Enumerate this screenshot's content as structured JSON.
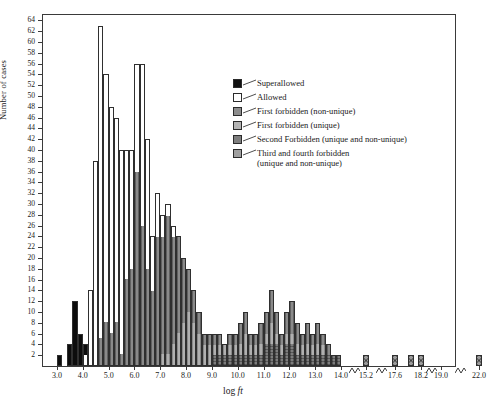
{
  "chart_data": {
    "type": "bar",
    "title": "",
    "xlabel": "log ft",
    "ylabel": "Number of cases",
    "ylim": [
      0,
      65
    ],
    "ytick_step": 2,
    "ytick_labels": [
      "2",
      "4",
      "6",
      "8",
      "10",
      "12",
      "14",
      "16",
      "18",
      "20",
      "22",
      "24",
      "26",
      "28",
      "30",
      "32",
      "34",
      "36",
      "38",
      "40",
      "42",
      "44",
      "46",
      "48",
      "50",
      "52",
      "54",
      "56",
      "58",
      "60",
      "62",
      "64"
    ],
    "xtick_labels": [
      "3.0",
      "4.0",
      "5.0",
      "6.0",
      "7.0",
      "8.0",
      "9.0",
      "10.0",
      "11.0",
      "12.0",
      "13.0",
      "14.0",
      "15.2",
      "17.6",
      "18.2",
      "19.0",
      "22.0"
    ],
    "grid": false,
    "legend_position": "upper-right",
    "axis_breaks": [
      "14.0-15.2",
      "15.2-17.6",
      "18.2-19.0",
      "19.0-22.0"
    ],
    "bin_width": 0.2,
    "categories": [
      "3.0",
      "3.2",
      "3.4",
      "3.6",
      "3.8",
      "4.0",
      "4.2",
      "4.4",
      "4.6",
      "4.8",
      "5.0",
      "5.2",
      "5.4",
      "5.6",
      "5.8",
      "6.0",
      "6.2",
      "6.4",
      "6.6",
      "6.8",
      "7.0",
      "7.2",
      "7.4",
      "7.6",
      "7.8",
      "8.0",
      "8.2",
      "8.4",
      "8.6",
      "8.8",
      "9.0",
      "9.2",
      "9.4",
      "9.6",
      "9.8",
      "10.0",
      "10.2",
      "10.4",
      "10.6",
      "10.8",
      "11.0",
      "11.2",
      "11.4",
      "11.6",
      "11.8",
      "12.0",
      "12.2",
      "12.4",
      "12.6",
      "12.8",
      "13.0",
      "13.2",
      "13.4",
      "13.6",
      "13.8",
      "15.2",
      "17.6",
      "18.0",
      "18.2",
      "19.0",
      "22.0"
    ],
    "series": [
      {
        "name": "Superallowed",
        "color": "#0d0d0d",
        "values": [
          2,
          0,
          4,
          12,
          6,
          2,
          0,
          0,
          0,
          0,
          0,
          0,
          0,
          0,
          0,
          0,
          0,
          0,
          0,
          0,
          0,
          0,
          0,
          0,
          0,
          0,
          0,
          0,
          0,
          0,
          0,
          0,
          0,
          0,
          0,
          0,
          0,
          0,
          0,
          0,
          0,
          0,
          0,
          0,
          0,
          0,
          0,
          0,
          0,
          0,
          0,
          0,
          0,
          0,
          0,
          0,
          0,
          0,
          0,
          0,
          0
        ]
      },
      {
        "name": "Allowed",
        "color": "#ffffff",
        "values": [
          0,
          0,
          0,
          0,
          0,
          2,
          14,
          38,
          58,
          46,
          42,
          38,
          38,
          24,
          22,
          20,
          30,
          24,
          10,
          8,
          4,
          2,
          2,
          0,
          0,
          0,
          0,
          0,
          0,
          0,
          0,
          0,
          0,
          0,
          0,
          0,
          0,
          0,
          0,
          0,
          0,
          0,
          0,
          0,
          0,
          0,
          0,
          0,
          0,
          0,
          0,
          0,
          0,
          0,
          0,
          0,
          0,
          0,
          0,
          0,
          0
        ]
      },
      {
        "name": "First forbidden (non-unique)",
        "color": "#8a8a8a",
        "values": [
          0,
          0,
          0,
          0,
          0,
          0,
          0,
          0,
          5,
          8,
          6,
          8,
          2,
          16,
          18,
          36,
          26,
          18,
          14,
          24,
          22,
          26,
          20,
          18,
          12,
          8,
          6,
          4,
          2,
          2,
          2,
          2,
          0,
          2,
          2,
          4,
          4,
          2,
          2,
          4,
          4,
          6,
          4,
          2,
          4,
          6,
          4,
          2,
          4,
          2,
          4,
          2,
          2,
          0,
          0,
          0,
          0,
          0,
          0,
          0,
          0
        ]
      },
      {
        "name": "First forbidden (unique)",
        "color": "#b0b0b0",
        "values": [
          0,
          0,
          0,
          0,
          0,
          0,
          0,
          0,
          0,
          0,
          0,
          0,
          0,
          0,
          0,
          0,
          0,
          0,
          0,
          0,
          2,
          2,
          4,
          6,
          8,
          10,
          8,
          6,
          4,
          4,
          2,
          2,
          2,
          2,
          2,
          2,
          4,
          2,
          2,
          2,
          2,
          4,
          2,
          2,
          2,
          2,
          2,
          2,
          2,
          2,
          2,
          2,
          0,
          0,
          0,
          0,
          0,
          0,
          0,
          0,
          0
        ]
      },
      {
        "name": "Second Forbidden (unique and non-unique)",
        "color": "#7d7d7d",
        "values": [
          0,
          0,
          0,
          0,
          0,
          0,
          0,
          0,
          0,
          0,
          0,
          0,
          0,
          0,
          0,
          0,
          0,
          0,
          0,
          0,
          0,
          0,
          0,
          0,
          0,
          0,
          0,
          0,
          0,
          0,
          2,
          2,
          2,
          2,
          2,
          2,
          2,
          2,
          2,
          2,
          4,
          4,
          4,
          2,
          4,
          4,
          2,
          2,
          2,
          2,
          2,
          2,
          2,
          2,
          2,
          0,
          0,
          0,
          0,
          0,
          0
        ]
      },
      {
        "name": "Third and fourth forbidden (unique and non-unique)",
        "color": "#9c9c9c",
        "values": [
          0,
          0,
          0,
          0,
          0,
          0,
          0,
          0,
          0,
          0,
          0,
          0,
          0,
          0,
          0,
          0,
          0,
          0,
          0,
          0,
          0,
          0,
          0,
          0,
          0,
          0,
          0,
          0,
          0,
          0,
          0,
          0,
          0,
          0,
          0,
          0,
          0,
          0,
          0,
          0,
          0,
          0,
          0,
          0,
          0,
          0,
          0,
          0,
          0,
          0,
          0,
          0,
          0,
          0,
          0,
          2,
          2,
          2,
          2,
          0,
          2
        ]
      }
    ]
  },
  "legend": {
    "items": [
      {
        "label": "Superallowed",
        "swatch": "superallowed",
        "label2": ""
      },
      {
        "label": "Allowed",
        "swatch": "allowed",
        "label2": ""
      },
      {
        "label": "First forbidden (non-unique)",
        "swatch": "first-nonuniq",
        "label2": ""
      },
      {
        "label": "First forbidden (unique)",
        "swatch": "first-uniq",
        "label2": ""
      },
      {
        "label": "Second Forbidden (unique and non-unique)",
        "swatch": "second",
        "label2": ""
      },
      {
        "label": "Third and fourth forbidden",
        "swatch": "third",
        "label2": "(unique and non-unique)"
      }
    ]
  },
  "axes": {
    "ylabel": "Number of cases",
    "xlabel_prefix": "log ",
    "xlabel_italic": "ft"
  }
}
